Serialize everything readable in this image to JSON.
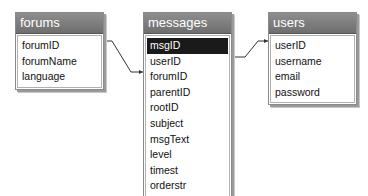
{
  "diagram": {
    "tables": [
      {
        "name": "forums",
        "fields": [
          "forumID",
          "forumName",
          "language"
        ]
      },
      {
        "name": "messages",
        "fields": [
          "msgID",
          "userID",
          "forumID",
          "parentID",
          "rootID",
          "subject",
          "msgText",
          "level",
          "timest",
          "orderstr"
        ],
        "selected_field": "msgID"
      },
      {
        "name": "users",
        "fields": [
          "userID",
          "username",
          "email",
          "password"
        ]
      }
    ],
    "relationships": [
      {
        "from": "forums.forumID",
        "to": "messages.forumID"
      },
      {
        "from": "messages.userID",
        "to": "users.userID"
      }
    ],
    "colors": {
      "title_bar": "#7a7a7a",
      "selected_row": "#1a1a1a",
      "connector": "#333333"
    }
  }
}
